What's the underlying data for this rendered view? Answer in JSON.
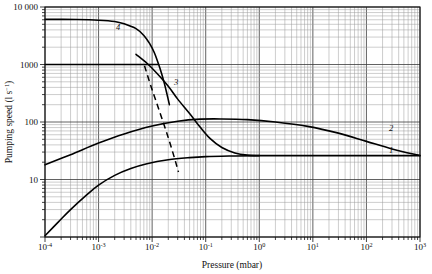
{
  "figure": {
    "background_color": "#ffffff",
    "axis_color": "#111111",
    "grid_minor_color": "#9a9a9a",
    "grid_major_color": "#3a3a3a",
    "curve_color": "#000000"
  },
  "axes": {
    "x": {
      "title_text": "Pressure (mbar)",
      "base": "10",
      "exponents": [
        "-4",
        "-3",
        "-2",
        "-1",
        "0",
        "1",
        "2",
        "3"
      ],
      "range": [
        0.0001,
        1000
      ]
    },
    "y": {
      "title_main": "Pumping speed (l s",
      "title_sup": "−1",
      "title_close": ")",
      "labels": [
        "10 000",
        "1000",
        "100",
        "10"
      ],
      "range": [
        1,
        10000
      ]
    }
  },
  "curve_labels": [
    {
      "id": "label-4",
      "text": "4",
      "x_px": 118,
      "y_px": 30
    },
    {
      "id": "label-3",
      "text": "3",
      "x_px": 176,
      "y_px": 85
    },
    {
      "id": "label-2",
      "text": "2",
      "x_px": 391,
      "y_px": 131
    },
    {
      "id": "label-1",
      "text": "1",
      "x_px": 391,
      "y_px": 153
    }
  ],
  "chart_data": {
    "type": "line",
    "title": "",
    "xlabel": "Pressure (mbar)",
    "ylabel": "Pumping speed (l s⁻¹)",
    "xscale": "log",
    "yscale": "log",
    "xlim": [
      0.0001,
      1000
    ],
    "ylim": [
      1,
      10000
    ],
    "grid": true,
    "legend": "inline-curve-numbers",
    "xticks": [
      0.0001,
      0.001,
      0.01,
      0.1,
      1,
      10,
      100,
      1000
    ],
    "xticklabels": [
      "10^-4",
      "10^-3",
      "10^-2",
      "10^-1",
      "10^0",
      "10^1",
      "10^2",
      "10^3"
    ],
    "yticks": [
      10,
      100,
      1000,
      10000
    ],
    "yticklabels": [
      "10",
      "100",
      "1000",
      "10 000"
    ],
    "series": [
      {
        "name": "1",
        "style": "solid",
        "points": [
          [
            0.0001,
            1.05
          ],
          [
            0.00018,
            1.85
          ],
          [
            0.0003,
            3.0
          ],
          [
            0.0006,
            5.4
          ],
          [
            0.001,
            8.0
          ],
          [
            0.002,
            11.8
          ],
          [
            0.004,
            15.5
          ],
          [
            0.008,
            18.8
          ],
          [
            0.02,
            22.0
          ],
          [
            0.05,
            24.0
          ],
          [
            0.1,
            25.0
          ],
          [
            0.3,
            25.6
          ],
          [
            1.0,
            26.0
          ],
          [
            10,
            26.0
          ],
          [
            100,
            26.0
          ],
          [
            1000,
            26.0
          ]
        ]
      },
      {
        "name": "2",
        "style": "solid",
        "points": [
          [
            0.0001,
            18.0
          ],
          [
            0.0003,
            27.0
          ],
          [
            0.001,
            43.0
          ],
          [
            0.003,
            62.0
          ],
          [
            0.01,
            85.0
          ],
          [
            0.03,
            103.0
          ],
          [
            0.08,
            112.0
          ],
          [
            0.2,
            113.0
          ],
          [
            0.6,
            110.0
          ],
          [
            2.0,
            100.0
          ],
          [
            8.0,
            84.0
          ],
          [
            30,
            64.0
          ],
          [
            100,
            46.0
          ],
          [
            300,
            34.0
          ],
          [
            1000,
            26.0
          ]
        ]
      },
      {
        "name": "3",
        "style": "solid",
        "points": [
          [
            0.005,
            1500.0
          ],
          [
            0.008,
            1050.0
          ],
          [
            0.012,
            720.0
          ],
          [
            0.02,
            420.0
          ],
          [
            0.03,
            250.0
          ],
          [
            0.05,
            140.0
          ],
          [
            0.08,
            80.0
          ],
          [
            0.12,
            52.0
          ],
          [
            0.2,
            36.0
          ],
          [
            0.35,
            29.0
          ],
          [
            0.6,
            26.5
          ],
          [
            1.0,
            26.0
          ]
        ]
      },
      {
        "name": "4",
        "style": "solid",
        "points": [
          [
            0.0001,
            6100.0
          ],
          [
            0.0004,
            6050.0
          ],
          [
            0.001,
            5900.0
          ],
          [
            0.002,
            5600.0
          ],
          [
            0.003,
            5100.0
          ],
          [
            0.005,
            4200.0
          ],
          [
            0.007,
            3200.0
          ],
          [
            0.009,
            2300.0
          ],
          [
            0.011,
            1600.0
          ],
          [
            0.013,
            1050.0
          ],
          [
            0.015,
            700.0
          ],
          [
            0.017,
            460.0
          ],
          [
            0.019,
            300.0
          ],
          [
            0.021,
            200.0
          ]
        ]
      },
      {
        "name": "dashed-transition",
        "style": "dashed",
        "points": [
          [
            0.0072,
            950.0
          ],
          [
            0.0095,
            420.0
          ],
          [
            0.0135,
            160.0
          ],
          [
            0.019,
            62.0
          ],
          [
            0.026,
            24.0
          ],
          [
            0.031,
            13.5
          ]
        ]
      },
      {
        "name": "top-horizontal-1000",
        "style": "solid",
        "points": [
          [
            0.0001,
            1000.0
          ],
          [
            0.0128,
            1000.0
          ]
        ]
      }
    ]
  }
}
